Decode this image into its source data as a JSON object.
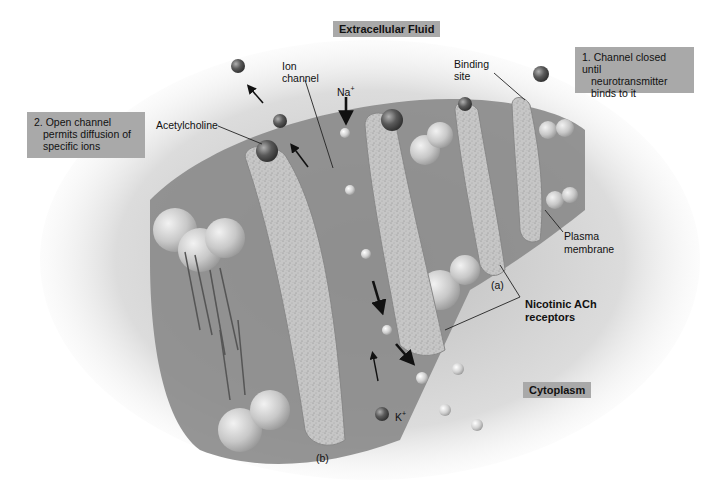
{
  "diagram": {
    "title_regions": {
      "extracellular": "Extracellular Fluid",
      "cytoplasm": "Cytoplasm"
    },
    "steps": [
      {
        "number": "1.",
        "text": "Channel closed until neurotransmitter binds to it",
        "lines": [
          "1. Channel closed until",
          "neurotransmitter",
          "binds to it"
        ]
      },
      {
        "number": "2.",
        "text": "Open channel permits diffusion of specific ions",
        "lines": [
          "2. Open channel",
          "permits diffusion of",
          "specific ions"
        ]
      }
    ],
    "labels": {
      "acetylcholine": "Acetylcholine",
      "ion_channel_1": "Ion",
      "ion_channel_2": "channel",
      "na": "Na",
      "na_sup": "+",
      "binding_site_1": "Binding",
      "binding_site_2": "site",
      "plasma_membrane_1": "Plasma",
      "plasma_membrane_2": "membrane",
      "receptor_a": "(a)",
      "receptor_b": "(b)",
      "nicotinic_1": "Nicotinic ACh",
      "nicotinic_2": "receptors",
      "k": "K",
      "k_sup": "+"
    },
    "colors": {
      "label_box": "#a9a9a9",
      "membrane_dark": "#6e6e6e",
      "membrane_mid": "#8c8c8c",
      "protein_speckle": "#c4c4c4",
      "phospholipid_head": "#cfcfcf",
      "ion_dark": "#4a4a4a",
      "ion_light": "#d8d8d8"
    }
  }
}
